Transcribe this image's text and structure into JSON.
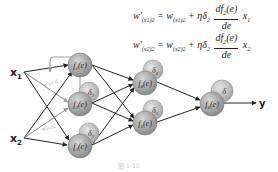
{
  "equations": [
    {
      "lhs": "w'(x1)2",
      "rhs_w": "w(x1)2",
      "eta_delta": "ηδ2",
      "num": "df2(e)",
      "den": "de",
      "x": "x1"
    },
    {
      "lhs": "w'(x2)2",
      "rhs_w": "w(x2)2",
      "eta_delta": "ηδ2",
      "num": "df2(e)",
      "den": "de",
      "x": "x2"
    }
  ],
  "inputs": [
    {
      "label": "x1",
      "sub": "1"
    },
    {
      "label": "x2",
      "sub": "2"
    }
  ],
  "weight_labels": [
    "w'(x1)2",
    "w'(x2)2"
  ],
  "layer1": [
    {
      "fn": "f1(e)"
    },
    {
      "fn": "f2(e)",
      "delta": "δ2"
    },
    {
      "fn": "f3(e)",
      "delta": "δ3"
    }
  ],
  "layer2": [
    {
      "fn": "f4(e)",
      "delta": "δ4"
    },
    {
      "fn": "f5(e)",
      "delta": "δ5"
    }
  ],
  "output_node": {
    "fn": "f6(e)",
    "delta": "δ"
  },
  "output_label": "y",
  "caption": "图 1-10",
  "colors": {
    "node_fill": "#9a9a9a",
    "node_stroke": "#777777",
    "arrow": "#222222",
    "feedback_arrow": "#999999",
    "delta_fill": "#c4c4c4"
  }
}
